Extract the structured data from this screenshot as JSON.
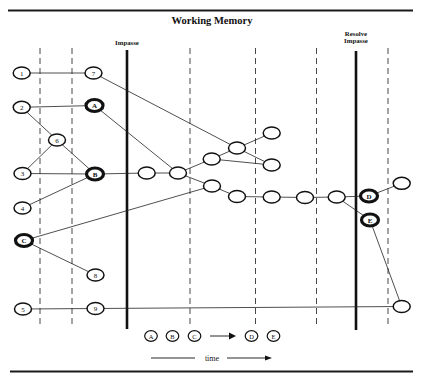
{
  "title": "Working Memory",
  "markers": {
    "impasse": "Impasse",
    "resolve_line1": "Resolve",
    "resolve_line2": "Impasse"
  },
  "nodes": [
    {
      "id": "n1",
      "label": "1",
      "bold": false
    },
    {
      "id": "n7",
      "label": "7",
      "bold": false
    },
    {
      "id": "n2",
      "label": "2",
      "bold": false
    },
    {
      "id": "nA",
      "label": "A",
      "bold": true
    },
    {
      "id": "n6",
      "label": "6",
      "bold": false
    },
    {
      "id": "n3",
      "label": "3",
      "bold": false
    },
    {
      "id": "nB",
      "label": "B",
      "bold": true
    },
    {
      "id": "n4",
      "label": "4",
      "bold": false
    },
    {
      "id": "nC",
      "label": "C",
      "bold": true
    },
    {
      "id": "n8",
      "label": "8",
      "bold": false
    },
    {
      "id": "n5",
      "label": "5",
      "bold": false
    },
    {
      "id": "n9",
      "label": "9",
      "bold": false
    },
    {
      "id": "u1",
      "label": "",
      "bold": false
    },
    {
      "id": "u2",
      "label": "",
      "bold": false
    },
    {
      "id": "u3",
      "label": "",
      "bold": false
    },
    {
      "id": "u4",
      "label": "",
      "bold": false
    },
    {
      "id": "u5",
      "label": "",
      "bold": false
    },
    {
      "id": "u6",
      "label": "",
      "bold": false
    },
    {
      "id": "u7",
      "label": "",
      "bold": false
    },
    {
      "id": "u8",
      "label": "",
      "bold": false
    },
    {
      "id": "u9",
      "label": "",
      "bold": false
    },
    {
      "id": "u10",
      "label": "",
      "bold": false
    },
    {
      "id": "u11",
      "label": "",
      "bold": false
    },
    {
      "id": "nD",
      "label": "D",
      "bold": true
    },
    {
      "id": "nE",
      "label": "E",
      "bold": true
    },
    {
      "id": "u12",
      "label": "",
      "bold": false
    },
    {
      "id": "u13",
      "label": "",
      "bold": false
    }
  ],
  "edges": [
    [
      "n1",
      "n7"
    ],
    [
      "n2",
      "nA"
    ],
    [
      "n2",
      "n6"
    ],
    [
      "n6",
      "n3"
    ],
    [
      "n6",
      "nB"
    ],
    [
      "n3",
      "nB"
    ],
    [
      "n4",
      "nB"
    ],
    [
      "nC",
      "n8"
    ],
    [
      "nC",
      "u7"
    ],
    [
      "n5",
      "n9"
    ],
    [
      "n9",
      "u13"
    ],
    [
      "n7",
      "u4"
    ],
    [
      "nA",
      "u2"
    ],
    [
      "nB",
      "u1"
    ],
    [
      "u1",
      "u2"
    ],
    [
      "u2",
      "u3"
    ],
    [
      "u2",
      "u7"
    ],
    [
      "u3",
      "u4"
    ],
    [
      "u3",
      "u6"
    ],
    [
      "u4",
      "u5"
    ],
    [
      "u4",
      "u6"
    ],
    [
      "u7",
      "u8"
    ],
    [
      "u8",
      "u9"
    ],
    [
      "u9",
      "u10"
    ],
    [
      "u10",
      "u11"
    ],
    [
      "u11",
      "nD"
    ],
    [
      "u11",
      "nE"
    ],
    [
      "nD",
      "u12"
    ],
    [
      "nE",
      "u13"
    ]
  ],
  "legend": {
    "before": [
      "A",
      "B",
      "C"
    ],
    "after": [
      "D",
      "E"
    ],
    "axis_label": "time"
  }
}
